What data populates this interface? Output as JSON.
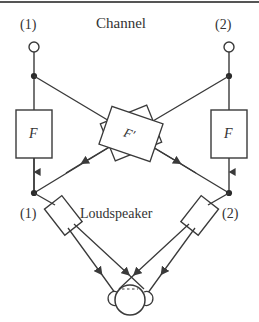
{
  "figure": {
    "title": "Channel",
    "subtitle": "Loudspeaker",
    "ports_top": [
      {
        "label": "(1)",
        "name": "channel-input-1"
      },
      {
        "label": "(2)",
        "name": "channel-input-2"
      }
    ],
    "ports_bottom": [
      {
        "label": "(1)",
        "name": "loudspeaker-label-1"
      },
      {
        "label": "(2)",
        "name": "loudspeaker-label-2"
      }
    ],
    "filters_direct": [
      {
        "label": "F",
        "name": "filter-box-left"
      },
      {
        "label": "F",
        "name": "filter-box-right"
      }
    ],
    "filter_cross": {
      "label": "F′",
      "name": "filter-box-cross"
    },
    "listener": {
      "name": "listener-head"
    },
    "colors": {
      "stroke": "#3a3a3a",
      "fill": "#ffffff",
      "text": "#333333",
      "background": "#ffffff",
      "top_rule": "#555555"
    }
  }
}
